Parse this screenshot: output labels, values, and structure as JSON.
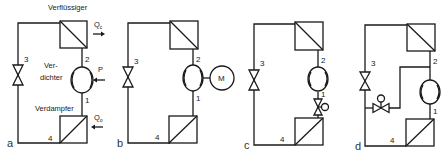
{
  "diagram": {
    "colors": {
      "line": "#1a1a1a",
      "background": "#ffffff"
    },
    "panels": [
      {
        "id": "a",
        "label": "a",
        "components": {
          "condenser": "Verflüssiger",
          "compressor_l1": "Ver-",
          "compressor_l2": "dichter",
          "evaporator": "Verdampfer",
          "heat_out": "Q",
          "heat_out_sub": "c",
          "heat_in": "Q",
          "heat_in_sub": "o",
          "power": "P"
        },
        "points": [
          "1",
          "2",
          "3",
          "4"
        ]
      },
      {
        "id": "b",
        "label": "b",
        "components": {
          "motor": "M"
        },
        "points": [
          "1",
          "2",
          "3",
          "4"
        ]
      },
      {
        "id": "c",
        "label": "c",
        "points": [
          "1",
          "2",
          "3",
          "4"
        ]
      },
      {
        "id": "d",
        "label": "d",
        "points": [
          "1",
          "2",
          "3",
          "4"
        ]
      }
    ]
  }
}
